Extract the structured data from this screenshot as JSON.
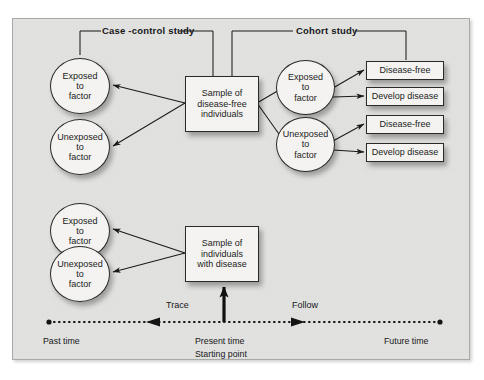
{
  "diagram": {
    "background_color": "#e3e3e1",
    "node_fill": "#f4f3f1",
    "stroke_color": "#2a2a2a"
  },
  "brackets": [
    {
      "id": "case-control",
      "label": "Case -control study"
    },
    {
      "id": "cohort",
      "label": "Cohort study"
    }
  ],
  "case_control_nodes": [
    {
      "id": "cc-exposed",
      "line1": "Exposed",
      "line2": "to",
      "line3": "factor"
    },
    {
      "id": "cc-unexposed",
      "line1": "Unexposed",
      "line2": "to",
      "line3": "factor"
    }
  ],
  "cohort_nodes": [
    {
      "id": "co-exposed",
      "line1": "Exposed",
      "line2": "to",
      "line3": "factor"
    },
    {
      "id": "co-unexposed",
      "line1": "Unexposed",
      "line2": "to",
      "line3": "factor"
    }
  ],
  "retrospective_nodes": [
    {
      "id": "retro-exposed",
      "line1": "Exposed",
      "line2": "to",
      "line3": "factor"
    },
    {
      "id": "retro-unexposed",
      "line1": "Unexposed",
      "line2": "to",
      "line3": "factor"
    }
  ],
  "sample_boxes": [
    {
      "id": "sample-disease-free",
      "line1": "Sample of",
      "line2": "disease-free",
      "line3": "individuals"
    },
    {
      "id": "sample-with-disease",
      "line1": "Sample of",
      "line2": "individuals",
      "line3": "with disease"
    }
  ],
  "outcomes": [
    {
      "id": "outcome-1",
      "label": "Disease-free"
    },
    {
      "id": "outcome-2",
      "label": "Develop disease"
    },
    {
      "id": "outcome-3",
      "label": "Disease-free"
    },
    {
      "id": "outcome-4",
      "label": "Develop disease"
    }
  ],
  "timeline": {
    "trace_label": "Trace",
    "follow_label": "Follow",
    "past_label": "Past time",
    "present_label": "Present time",
    "starting_label": "Starting point",
    "future_label": "Future time"
  }
}
